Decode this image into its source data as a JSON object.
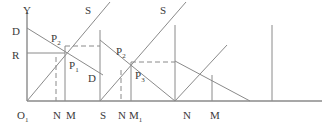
{
  "figure": {
    "title": "",
    "axes": {
      "y_label": "Y",
      "origin_label": "O",
      "origin_sub": "1"
    },
    "labels": [
      {
        "name": "y-axis-label",
        "text": "Y",
        "sub": "",
        "x": 23,
        "y": 5
      },
      {
        "name": "demand-intercept-D",
        "text": "D",
        "sub": "",
        "x": 12,
        "y": 26
      },
      {
        "name": "price-level-R",
        "text": "R",
        "sub": "",
        "x": 12,
        "y": 50
      },
      {
        "name": "origin-label-O1",
        "text": "O",
        "sub": "1",
        "x": 17,
        "y": 110
      },
      {
        "name": "supply-label-S1",
        "text": "S",
        "sub": "",
        "x": 85,
        "y": 5
      },
      {
        "name": "supply-label-S2",
        "text": "S",
        "sub": "",
        "x": 160,
        "y": 5
      },
      {
        "name": "demand-label-D2",
        "text": "D",
        "sub": "",
        "x": 88,
        "y": 73
      },
      {
        "name": "point-label-P2-left",
        "text": "P",
        "sub": "2",
        "x": 51,
        "y": 33
      },
      {
        "name": "point-label-P1",
        "text": "P",
        "sub": "1",
        "x": 69,
        "y": 60
      },
      {
        "name": "point-label-P2-mid",
        "text": "P",
        "sub": "2",
        "x": 116,
        "y": 46
      },
      {
        "name": "point-label-P3",
        "text": "P",
        "sub": "3",
        "x": 135,
        "y": 70
      },
      {
        "name": "quantity-N-1",
        "text": "N",
        "sub": "",
        "x": 53,
        "y": 110
      },
      {
        "name": "quantity-M-1",
        "text": "M",
        "sub": "",
        "x": 66,
        "y": 110
      },
      {
        "name": "segment-start-S",
        "text": "S",
        "sub": "",
        "x": 100,
        "y": 110
      },
      {
        "name": "quantity-N-2",
        "text": "N",
        "sub": "",
        "x": 118,
        "y": 110
      },
      {
        "name": "quantity-M1",
        "text": "M",
        "sub": "1",
        "x": 129,
        "y": 110
      },
      {
        "name": "quantity-N-3",
        "text": "N",
        "sub": "",
        "x": 183,
        "y": 110
      },
      {
        "name": "quantity-M-3",
        "text": "M",
        "sub": "",
        "x": 210,
        "y": 110
      }
    ]
  },
  "chart_data": {
    "type": "line",
    "title": "",
    "xlabel": "",
    "ylabel": "Y",
    "grid": false,
    "legend": "none",
    "axis": {
      "x_axis": {
        "x1": 27,
        "y1": 101,
        "x2": 322,
        "y2": 101
      },
      "y_axis": {
        "x1": 27,
        "y1": 12,
        "x2": 27,
        "y2": 101
      },
      "origin": {
        "x": 27,
        "y": 101
      }
    },
    "price_levels": {
      "D": 28,
      "R": 53
    },
    "series": [
      {
        "name": "demand-curve-1",
        "style": "solid",
        "color": "#8a8a8a",
        "points": [
          [
            27,
            28
          ],
          [
            103,
            75
          ]
        ]
      },
      {
        "name": "supply-curve-1",
        "style": "solid",
        "color": "#8a8a8a",
        "points": [
          [
            27,
            101
          ],
          [
            110,
            2
          ]
        ]
      },
      {
        "name": "demand-curve-2",
        "style": "solid",
        "color": "#8a8a8a",
        "points": [
          [
            100,
            40
          ],
          [
            175,
            101
          ]
        ]
      },
      {
        "name": "supply-curve-2",
        "style": "solid",
        "color": "#8a8a8a",
        "points": [
          [
            100,
            101
          ],
          [
            186,
            2
          ]
        ]
      },
      {
        "name": "demand-curve-3",
        "style": "solid",
        "color": "#8a8a8a",
        "points": [
          [
            175,
            61
          ],
          [
            250,
            101
          ]
        ]
      },
      {
        "name": "supply-curve-3",
        "style": "solid",
        "color": "#8a8a8a",
        "points": [
          [
            175,
            101
          ],
          [
            227,
            45
          ]
        ]
      }
    ],
    "reference_lines": [
      {
        "name": "price-line-R",
        "style": "solid",
        "color": "#8a8a8a",
        "points": [
          [
            27,
            53
          ],
          [
            65,
            53
          ]
        ]
      },
      {
        "name": "dashed-level-upper",
        "style": "dashed",
        "color": "#8a8a8a",
        "points": [
          [
            65,
            46
          ],
          [
            100,
            46
          ]
        ]
      },
      {
        "name": "dashed-level-lower",
        "style": "dashed",
        "color": "#8a8a8a",
        "points": [
          [
            131,
            62
          ],
          [
            175,
            62
          ]
        ]
      }
    ],
    "verticals": [
      {
        "name": "vline-N-1",
        "style": "dashed",
        "color": "#8a8a8a",
        "x": 56,
        "y1": 57,
        "y2": 101
      },
      {
        "name": "vline-M-1",
        "style": "solid",
        "color": "#8a8a8a",
        "x": 65,
        "y1": 46,
        "y2": 101
      },
      {
        "name": "vline-S-1",
        "style": "solid",
        "color": "#8a8a8a",
        "x": 100,
        "y1": 30,
        "y2": 101
      },
      {
        "name": "vline-N-2",
        "style": "dashed",
        "color": "#8a8a8a",
        "x": 121,
        "y1": 70,
        "y2": 101
      },
      {
        "name": "vline-M1",
        "style": "solid",
        "color": "#8a8a8a",
        "x": 131,
        "y1": 62,
        "y2": 101
      },
      {
        "name": "vline-N-3",
        "style": "solid",
        "color": "#8a8a8a",
        "x": 175,
        "y1": 25,
        "y2": 101
      },
      {
        "name": "vline-M-3",
        "style": "solid",
        "color": "#8a8a8a",
        "x": 212,
        "y1": 75,
        "y2": 101
      },
      {
        "name": "vline-right",
        "style": "solid",
        "color": "#8a8a8a",
        "x": 272,
        "y1": 25,
        "y2": 101
      }
    ],
    "equilibrium_points": [
      {
        "name": "P1",
        "x": 65,
        "y": 46
      },
      {
        "name": "P2_left",
        "x": 56,
        "y": 53
      },
      {
        "name": "P2_mid",
        "x": 121,
        "y": 62
      },
      {
        "name": "P3",
        "x": 131,
        "y": 62
      }
    ],
    "colors": {
      "stroke": "#8a8a8a",
      "text": "#3a3a3a",
      "background": "#ffffff"
    }
  }
}
